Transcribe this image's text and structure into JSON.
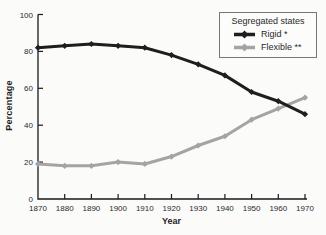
{
  "chart_data": {
    "type": "line",
    "title": "",
    "xlabel": "Year",
    "ylabel": "Percentage",
    "x": [
      1870,
      1880,
      1890,
      1900,
      1910,
      1920,
      1930,
      1940,
      1950,
      1960,
      1970
    ],
    "series": [
      {
        "name": "Rigid *",
        "color": "#1e1e1e",
        "values": [
          82,
          83,
          84,
          83,
          82,
          78,
          73,
          67,
          58,
          53,
          46
        ]
      },
      {
        "name": "Flexible **",
        "color": "#a4a4a4",
        "values": [
          19,
          18,
          18,
          20,
          19,
          23,
          29,
          34,
          43,
          49,
          55
        ]
      }
    ],
    "legend": {
      "title": "Segregated states",
      "position": "top-right"
    },
    "ylim": [
      0,
      100
    ],
    "yticks": [
      0,
      20,
      40,
      60,
      80,
      100
    ],
    "grid": false,
    "axis_color": "#1a1a1a",
    "marker": "diamond"
  }
}
